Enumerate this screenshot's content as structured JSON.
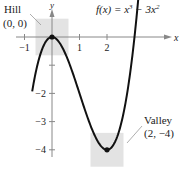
{
  "chart_data": {
    "type": "line",
    "title_parts": {
      "lhs": "f(x) = x",
      "exp1": "3",
      "mid": " − 3x",
      "exp2": "2"
    },
    "xlabel": "x",
    "ylabel": "y",
    "xlim": [
      -1.0,
      3.3
    ],
    "ylim": [
      -4.6,
      1.1
    ],
    "x_ticks": [
      {
        "value": -1,
        "label": "−1"
      },
      {
        "value": 1,
        "label": "1"
      },
      {
        "value": 2,
        "label": "2"
      }
    ],
    "y_ticks": [
      {
        "value": -1,
        "label": ""
      },
      {
        "value": -2,
        "label": "−2"
      },
      {
        "value": -3,
        "label": "−3"
      },
      {
        "value": -4,
        "label": "−4"
      }
    ],
    "grid": false,
    "series": [
      {
        "name": "f(x) = x^3 - 3x^2",
        "function": "x^3 - 3x^2",
        "x_range": [
          -0.72,
          3.3
        ],
        "color": "#111111"
      }
    ],
    "points": [
      {
        "name": "hill",
        "x": 0,
        "y": 0
      },
      {
        "name": "valley",
        "x": 2,
        "y": -4
      }
    ],
    "annotations": [
      {
        "name": "hill",
        "label": "Hill",
        "coords": "(0, 0)",
        "highlight_x": [
          -0.6,
          0.6
        ],
        "highlight_y": [
          -0.65,
          0.65
        ]
      },
      {
        "name": "valley",
        "label": "Valley",
        "coords": "(2, −4)",
        "highlight_x": [
          1.4,
          2.6
        ],
        "highlight_y": [
          -4.6,
          -3.4
        ]
      }
    ],
    "highlight_color": "#e3e3e3"
  }
}
